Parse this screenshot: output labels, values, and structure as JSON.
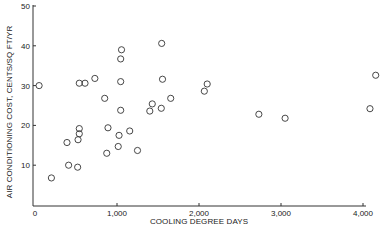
{
  "chart_data": {
    "type": "scatter",
    "title": "",
    "xlabel": "COOLING DEGREE DAYS",
    "ylabel": "AIR CONDITIONING COST, CENTS/SQ FT/YR",
    "xlim": [
      0,
      4100
    ],
    "ylim": [
      0,
      50
    ],
    "x_ticks": [
      0,
      1000,
      2000,
      3000,
      4000
    ],
    "x_tick_labels": [
      "0",
      "1,000",
      "2,000",
      "3,000",
      "4,000"
    ],
    "y_ticks": [
      10,
      20,
      30,
      40,
      50
    ],
    "y_tick_labels": [
      "10",
      "20",
      "30",
      "40",
      "50"
    ],
    "grid": false,
    "legend": null,
    "marker": "open-circle",
    "points": [
      {
        "x": 50,
        "y": 30.0
      },
      {
        "x": 200,
        "y": 6.8
      },
      {
        "x": 390,
        "y": 15.7
      },
      {
        "x": 410,
        "y": 10.0
      },
      {
        "x": 520,
        "y": 9.5
      },
      {
        "x": 525,
        "y": 16.4
      },
      {
        "x": 540,
        "y": 17.9
      },
      {
        "x": 540,
        "y": 19.2
      },
      {
        "x": 540,
        "y": 30.6
      },
      {
        "x": 610,
        "y": 30.6
      },
      {
        "x": 730,
        "y": 31.8
      },
      {
        "x": 850,
        "y": 26.8
      },
      {
        "x": 875,
        "y": 13.0
      },
      {
        "x": 890,
        "y": 19.4
      },
      {
        "x": 1015,
        "y": 14.7
      },
      {
        "x": 1025,
        "y": 17.5
      },
      {
        "x": 1045,
        "y": 23.8
      },
      {
        "x": 1045,
        "y": 31.0
      },
      {
        "x": 1045,
        "y": 36.7
      },
      {
        "x": 1055,
        "y": 39.0
      },
      {
        "x": 1155,
        "y": 18.6
      },
      {
        "x": 1250,
        "y": 13.7
      },
      {
        "x": 1400,
        "y": 23.6
      },
      {
        "x": 1430,
        "y": 25.4
      },
      {
        "x": 1540,
        "y": 24.3
      },
      {
        "x": 1545,
        "y": 40.6
      },
      {
        "x": 1555,
        "y": 31.6
      },
      {
        "x": 1655,
        "y": 26.8
      },
      {
        "x": 2065,
        "y": 28.6
      },
      {
        "x": 2100,
        "y": 30.4
      },
      {
        "x": 2730,
        "y": 22.8
      },
      {
        "x": 3050,
        "y": 21.8
      },
      {
        "x": 4085,
        "y": 24.2
      },
      {
        "x": 4155,
        "y": 32.6
      }
    ]
  },
  "layout": {
    "plot_left": 33,
    "plot_bottom": 206,
    "x0_px": 35,
    "x_px_per_unit": 0.082,
    "y0_px": 205,
    "y_px_per_unit": 3.98,
    "axis_right": 366,
    "axis_top": 5,
    "marker_radius": 3.1,
    "colors": {
      "ink": "#333333",
      "background": "#ffffff"
    }
  }
}
